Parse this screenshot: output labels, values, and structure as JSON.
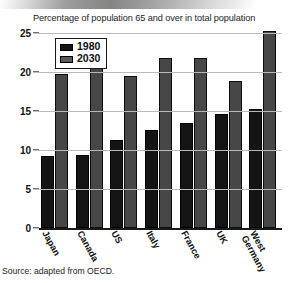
{
  "chart_data": {
    "type": "bar",
    "title": "Percentage of population 65 and over in total population",
    "xlabel": "",
    "ylabel": "",
    "ylim": [
      0,
      25
    ],
    "yticks": [
      25,
      20,
      15,
      10,
      5,
      0
    ],
    "grid": true,
    "legend_position": "top-left",
    "categories": [
      "Japan",
      "Canada",
      "US",
      "Italy",
      "France",
      "UK",
      "West Germany"
    ],
    "series": [
      {
        "name": "1980",
        "color": "#141414",
        "values": [
          9.2,
          9.4,
          11.3,
          12.6,
          13.5,
          14.6,
          15.3
        ]
      },
      {
        "name": "2030",
        "color": "#474747",
        "values": [
          19.8,
          22.3,
          19.5,
          21.8,
          21.8,
          18.8,
          25.3
        ]
      }
    ]
  },
  "source": {
    "text": "Source:  adapted from OECD."
  },
  "category_lines": [
    [
      "Japan",
      ""
    ],
    [
      "Canada",
      ""
    ],
    [
      "US",
      ""
    ],
    [
      "Italy",
      ""
    ],
    [
      "France",
      ""
    ],
    [
      "UK",
      ""
    ],
    [
      "West",
      "Germany"
    ]
  ]
}
